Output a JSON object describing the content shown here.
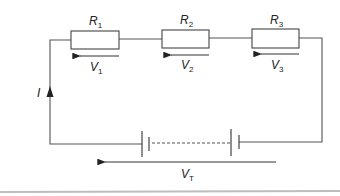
{
  "diagram": {
    "type": "series circuit",
    "current_label": {
      "symbol": "I",
      "direction": "up"
    },
    "resistors": [
      {
        "symbol": "R",
        "subscript": "1",
        "voltage_symbol": "V",
        "voltage_subscript": "1"
      },
      {
        "symbol": "R",
        "subscript": "2",
        "voltage_symbol": "V",
        "voltage_subscript": "2"
      },
      {
        "symbol": "R",
        "subscript": "3",
        "voltage_symbol": "V",
        "voltage_subscript": "3"
      }
    ],
    "battery": {
      "cells": "multiple (dashed between)",
      "total_voltage_symbol": "V",
      "total_voltage_subscript": "T"
    },
    "colors": {
      "line": "#555555",
      "background": "#ffffff",
      "separator": "#bdbdbd"
    }
  }
}
